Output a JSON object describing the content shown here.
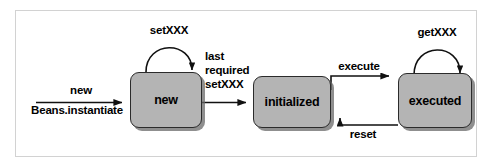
{
  "diagram": {
    "type": "uml-state-diagram",
    "frame": {
      "border_color": "#d2d2d2",
      "background": "#ffffff"
    },
    "state_fill": "#b4b4b4",
    "state_border": "#2b2b2b",
    "states": [
      {
        "id": "new",
        "label": "new"
      },
      {
        "id": "initialized",
        "label": "initialized"
      },
      {
        "id": "executed",
        "label": "executed"
      }
    ],
    "transitions": [
      {
        "id": "entry",
        "from": "",
        "to": "new",
        "label_top": "new",
        "label_bottom": "Beans.instantiate"
      },
      {
        "id": "self-new",
        "from": "new",
        "to": "new",
        "label": "setXXX"
      },
      {
        "id": "new-to-initialized",
        "from": "new",
        "to": "initialized",
        "label_line1": "last",
        "label_line2": "required",
        "label_line3": "setXXX"
      },
      {
        "id": "initialized-to-executed",
        "from": "initialized",
        "to": "executed",
        "label": "execute"
      },
      {
        "id": "executed-to-initialized",
        "from": "executed",
        "to": "initialized",
        "label": "reset"
      },
      {
        "id": "self-executed",
        "from": "executed",
        "to": "executed",
        "label": "getXXX"
      }
    ]
  }
}
